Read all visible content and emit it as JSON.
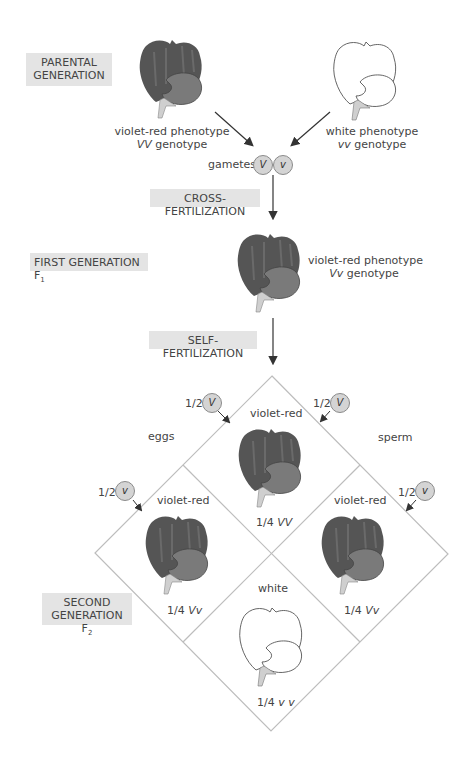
{
  "figure": {
    "generations": {
      "parental": {
        "label_line1": "PARENTAL",
        "label_line2": "GENERATION"
      },
      "first": {
        "label": "FIRST GENERATION F",
        "sub": "1"
      },
      "second": {
        "label_line1": "SECOND",
        "label_line2": "GENERATION F",
        "sub": "2"
      }
    },
    "steps": {
      "cross": "CROSS-FERTILIZATION",
      "self": "SELF-FERTILIZATION"
    },
    "parents": {
      "left": {
        "phenotype": "violet-red phenotype",
        "genotype_allele": "VV",
        "genotype_word": " genotype",
        "color": "violet-red"
      },
      "right": {
        "phenotype": "white phenotype",
        "genotype_allele": "vv",
        "genotype_word": " genotype",
        "color": "white"
      }
    },
    "gametes": {
      "label": "gametes",
      "alleles": [
        "V",
        "v"
      ]
    },
    "f1": {
      "phenotype": "violet-red phenotype",
      "genotype_allele": "Vv",
      "genotype_word": " genotype"
    },
    "punnett": {
      "eggs_label": "eggs",
      "sperm_label": "sperm",
      "gamete_inputs": [
        {
          "side": "eggs",
          "fraction": "1/2",
          "allele": "V"
        },
        {
          "side": "eggs",
          "fraction": "1/2",
          "allele": "v"
        },
        {
          "side": "sperm",
          "fraction": "1/2",
          "allele": "V"
        },
        {
          "side": "sperm",
          "fraction": "1/2",
          "allele": "v"
        }
      ],
      "cells": {
        "top": {
          "phenotype": "violet-red",
          "fraction": "1/4",
          "genotype": "VV"
        },
        "left": {
          "phenotype": "violet-red",
          "fraction": "1/4",
          "genotype": "Vv"
        },
        "right": {
          "phenotype": "violet-red",
          "fraction": "1/4",
          "genotype": "Vv"
        },
        "bottom": {
          "phenotype": "white",
          "fraction": "1/4",
          "genotype": "v v"
        }
      }
    },
    "colors": {
      "petal_dark": "#555555",
      "petal_lip": "#787878",
      "stem": "#cfcfcf",
      "label_bg": "#e4e4e4",
      "gamete_fill": "#d4d4d4",
      "line": "#bdbdbd",
      "arrow": "#333333"
    }
  }
}
